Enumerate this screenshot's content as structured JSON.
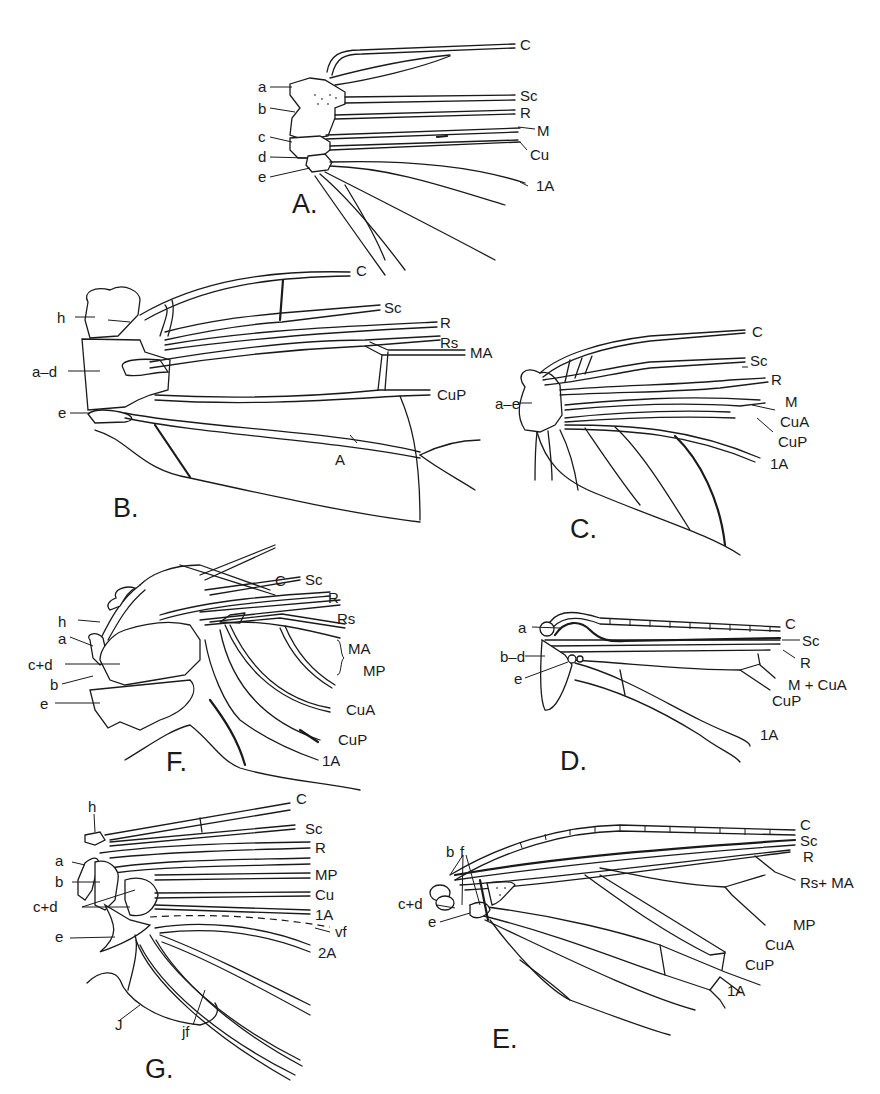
{
  "figure": {
    "panels": {
      "A": {
        "letter": "A.",
        "veins": [
          "C",
          "Sc",
          "R",
          "M",
          "Cu",
          "1A"
        ],
        "sclerites": [
          "a",
          "b",
          "c",
          "d",
          "e"
        ]
      },
      "B": {
        "letter": "B.",
        "veins": [
          "C",
          "Sc",
          "R",
          "Rs",
          "MA",
          "CuP",
          "A"
        ],
        "sclerites": [
          "h",
          "a–d",
          "e"
        ]
      },
      "C": {
        "letter": "C.",
        "veins": [
          "C",
          "Sc",
          "R",
          "M",
          "CuA",
          "CuP",
          "1A"
        ],
        "sclerites": [
          "a–e"
        ]
      },
      "D": {
        "letter": "D.",
        "veins": [
          "C",
          "Sc",
          "R",
          "M + CuA",
          "CuP",
          "1A"
        ],
        "sclerites": [
          "a",
          "b–d",
          "e"
        ]
      },
      "E": {
        "letter": "E.",
        "veins": [
          "C",
          "Sc",
          "R",
          "Rs+ MA",
          "MP",
          "CuA",
          "CuP",
          "1A"
        ],
        "sclerites": [
          "b",
          "f",
          "c+d",
          "e"
        ]
      },
      "F": {
        "letter": "F.",
        "veins": [
          "C",
          "Sc",
          "R",
          "Rs",
          "MA",
          "MP",
          "CuA",
          "CuP",
          "1A"
        ],
        "sclerites": [
          "h",
          "a",
          "c+d",
          "b",
          "e"
        ]
      },
      "G": {
        "letter": "G.",
        "veins": [
          "C",
          "Sc",
          "R",
          "MP",
          "Cu",
          "1A",
          "vf",
          "2A"
        ],
        "sclerites": [
          "h",
          "a",
          "b",
          "c+d",
          "e",
          "J",
          "jf"
        ]
      }
    }
  }
}
